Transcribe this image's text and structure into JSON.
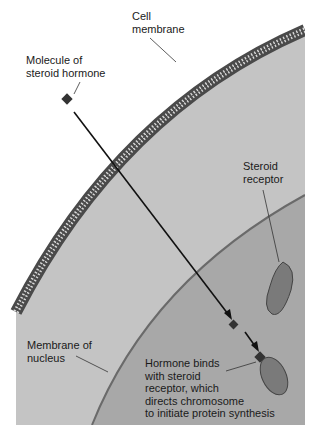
{
  "diagram": {
    "labels": {
      "cell_membrane": [
        "Cell",
        "membrane"
      ],
      "hormone_molecule": [
        "Molecule of",
        "steroid hormone"
      ],
      "steroid_receptor": [
        "Steroid",
        "receptor"
      ],
      "nuclear_membrane": [
        "Membrane of",
        "nucleus"
      ],
      "binding": [
        "Hormone binds",
        "with steroid",
        "receptor, which",
        "directs chromosome",
        "to initiate protein synthesis"
      ]
    },
    "colors": {
      "background": "#ffffff",
      "cytoplasm": "#c4c4c4",
      "nucleus": "#a8a8a8",
      "membrane": "#4a4a4a",
      "receptor": "#7a7a7a",
      "hormone": "#333333"
    }
  }
}
